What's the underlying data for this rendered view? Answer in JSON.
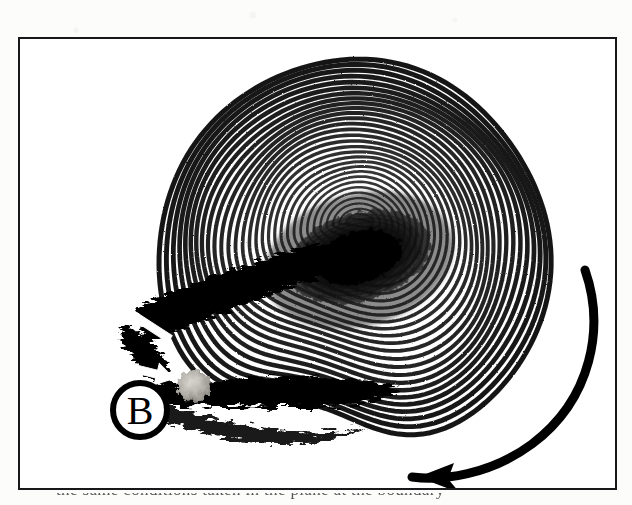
{
  "page": {
    "background_color": "#fcfcfa",
    "width": 632,
    "height": 505
  },
  "figure": {
    "frame": {
      "border_color": "#18181a",
      "border_width": 2,
      "x": 18,
      "y": 37,
      "width": 599,
      "height": 453,
      "background_color": "#ffffff"
    },
    "type": "flow-visualization-photograph",
    "ink_color": "#101010",
    "paper_color": "#ffffff"
  },
  "annotations": {
    "labels": [
      {
        "name": "label-B",
        "text": "B",
        "shape": "circle",
        "cx": 138,
        "cy": 408,
        "r": 28,
        "stroke_color": "#000000",
        "fill_color": "#ffffff",
        "text_color": "#000000",
        "font_size": 40
      }
    ],
    "white_arrows": [
      {
        "name": "white-arrow-up-right",
        "direction": "up-right",
        "angle_deg": -58,
        "from": [
          132,
          352
        ],
        "to": [
          180,
          288
        ],
        "color": "#ffffff"
      },
      {
        "name": "white-arrow-right",
        "direction": "right-slightly-down",
        "angle_deg": 12,
        "from": [
          110,
          363
        ],
        "to": [
          172,
          379
        ],
        "color": "#ffffff"
      }
    ],
    "black_curved_arrow": {
      "name": "rotation-direction-arrow",
      "meaning": "clockwise / swirl direction of the outer flow",
      "start": [
        583,
        268
      ],
      "end": [
        408,
        466
      ],
      "color": "#000000",
      "stroke_width": 9,
      "head_length": 34
    }
  },
  "chart_data": {
    "type": "contour",
    "title": "",
    "xlabel": "",
    "ylabel": "",
    "streamlines": {
      "count": 30,
      "center": [
        352,
        255
      ],
      "outer_rx": 196,
      "outer_ry": 196,
      "inner_rx": 14,
      "inner_ry": 9,
      "core_tilt_deg": -16,
      "line_color": "#0c0c0c",
      "line_width_outer": 5.0,
      "line_width_inner": 2.0
    },
    "core": {
      "name": "dark-vortex-core",
      "cx": 357,
      "cy": 239,
      "rx": 74,
      "ry": 44,
      "tilt_deg": -16,
      "color": "#000000"
    },
    "shear_layer": {
      "name": "dark-shear-streak",
      "from": [
        140,
        300
      ],
      "to": [
        330,
        245
      ],
      "thickness": 34,
      "color": "#050505"
    },
    "lower_dark_band": {
      "name": "dark-lower-band",
      "x_range": [
        150,
        400
      ],
      "y_center": 372,
      "thickness": 26,
      "color": "#050505"
    },
    "gray_blob": {
      "name": "light-gray-blob",
      "cx": 192,
      "cy": 384,
      "rx": 17,
      "ry": 16,
      "color": "#b8b6b0"
    },
    "boundary_notch": {
      "name": "lower-boundary-undulation",
      "trough_x": 300,
      "trough_y": 420,
      "description": "wavy dip in the lower streamline envelope"
    },
    "grid": false,
    "legend": false
  },
  "caption": {
    "name": "cropped-caption",
    "text": "the same conditions taken in the plane at the boundary",
    "visible": "top-of-letters-only"
  }
}
